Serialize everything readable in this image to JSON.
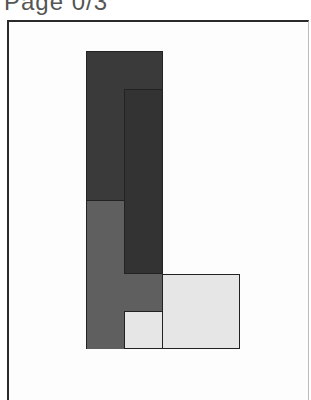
{
  "header": {
    "page_label": "Page 0/3"
  },
  "puzzle": {
    "colors": {
      "dark": "#3a3a3a",
      "darker": "#333333",
      "medium": "#5f5f5f",
      "light": "#e6e6e6",
      "outline": "#222222"
    },
    "pieces": [
      {
        "name": "dark-top-block",
        "color": "dark",
        "x": 86,
        "y": 51,
        "w": 77,
        "h": 149
      },
      {
        "name": "medium-lower-block",
        "color": "medium",
        "x": 86,
        "y": 200,
        "w": 77,
        "h": 111
      },
      {
        "name": "medium-bottom-left",
        "color": "medium",
        "x": 86,
        "y": 311,
        "w": 38,
        "h": 38
      },
      {
        "name": "dark-inner-vertical",
        "color": "darker",
        "x": 124,
        "y": 89,
        "w": 39,
        "h": 185
      },
      {
        "name": "light-l-shape-top",
        "color": "light",
        "x": 163,
        "y": 274,
        "w": 77,
        "h": 75
      },
      {
        "name": "light-l-shape-bottom",
        "color": "light",
        "x": 124,
        "y": 311,
        "w": 116,
        "h": 38
      }
    ]
  }
}
